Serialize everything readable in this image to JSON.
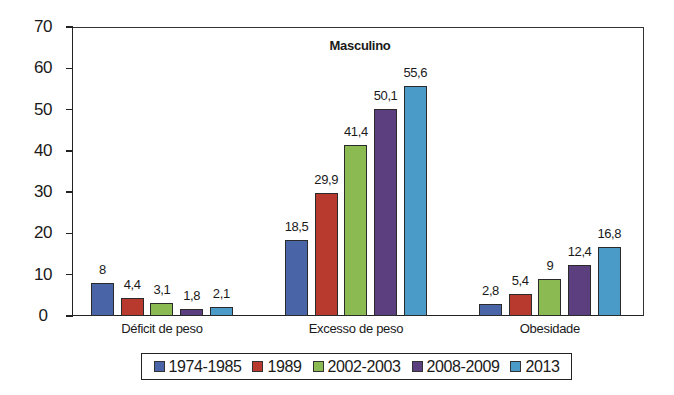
{
  "chart_data": {
    "type": "bar",
    "title": "Masculino",
    "xlabel": "",
    "ylabel": "",
    "ylim": [
      0,
      70
    ],
    "yticks": [
      0,
      10,
      20,
      30,
      40,
      50,
      60,
      70
    ],
    "grid": false,
    "legend_position": "bottom",
    "categories": [
      "Déficit de peso",
      "Excesso de peso",
      "Obesidade"
    ],
    "series": [
      {
        "name": "1974-1985",
        "color": "#4a64a8",
        "values": [
          8,
          18.5,
          2.8
        ],
        "labels": [
          "8",
          "18,5",
          "2,8"
        ]
      },
      {
        "name": "1989",
        "color": "#b83a2e",
        "values": [
          4.4,
          29.9,
          5.4
        ],
        "labels": [
          "4,4",
          "29,9",
          "5,4"
        ]
      },
      {
        "name": "2002-2003",
        "color": "#8cba52",
        "values": [
          3.1,
          41.4,
          9
        ],
        "labels": [
          "3,1",
          "41,4",
          "9"
        ]
      },
      {
        "name": "2008-2009",
        "color": "#5c3f7e",
        "values": [
          1.8,
          50.1,
          12.4
        ],
        "labels": [
          "1,8",
          "50,1",
          "12,4"
        ]
      },
      {
        "name": "2013",
        "color": "#4a9bc7",
        "values": [
          2.1,
          55.6,
          16.8
        ],
        "labels": [
          "2,1",
          "55,6",
          "16,8"
        ]
      }
    ]
  },
  "legend": {
    "items": [
      "1974-1985",
      "1989",
      "2002-2003",
      "2008-2009",
      "2013"
    ]
  }
}
